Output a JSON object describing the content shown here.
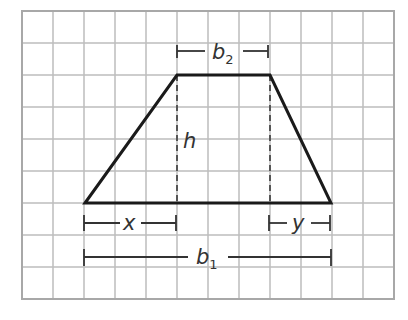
{
  "figure": {
    "type": "trapezoid-on-grid",
    "grid": {
      "columns": 12,
      "rows": 9,
      "color": "#bdbdbd",
      "border_color": "#a8a8a8"
    },
    "shape_color": "#1a1a1a",
    "labels": {
      "b2": {
        "main": "b",
        "sub": "2"
      },
      "h": "h",
      "x": "x",
      "y": "y",
      "b1": {
        "main": "b",
        "sub": "1"
      }
    }
  }
}
